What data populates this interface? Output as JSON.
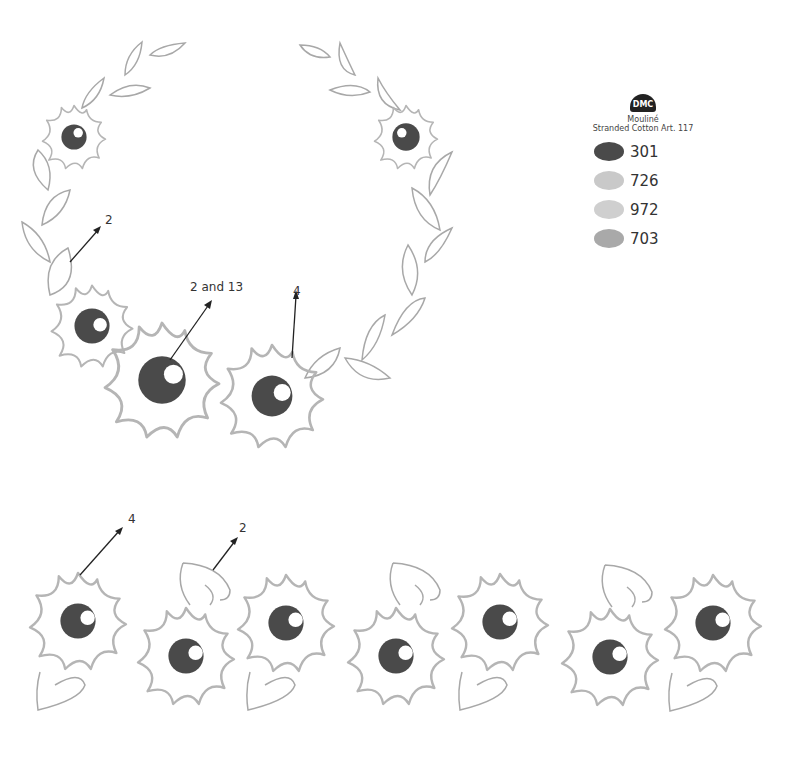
{
  "legend": {
    "logo_text": "DMC",
    "line1": "Mouliné",
    "line2": "Stranded Cotton Art. 117",
    "threads": [
      {
        "code": "301",
        "color": "#4a4a4a"
      },
      {
        "code": "726",
        "color": "#c9c9c9"
      },
      {
        "code": "972",
        "color": "#cfcfcf"
      },
      {
        "code": "703",
        "color": "#a9a9a9"
      }
    ]
  },
  "wreath_labels": [
    {
      "text": "2",
      "x": 105,
      "y": 213
    },
    {
      "text": "2 and 13",
      "x": 190,
      "y": 280
    },
    {
      "text": "4",
      "x": 293,
      "y": 284
    }
  ],
  "border_labels": [
    {
      "text": "4",
      "x": 128,
      "y": 512
    },
    {
      "text": "2",
      "x": 239,
      "y": 521
    }
  ]
}
